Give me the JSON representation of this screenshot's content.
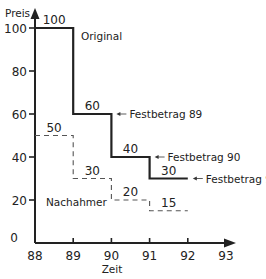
{
  "chart_data": {
    "type": "line",
    "title": "",
    "xlabel": "Zeit",
    "ylabel": "Preis",
    "xlim": [
      88,
      93
    ],
    "ylim": [
      0,
      100
    ],
    "x_ticks": [
      "88",
      "89",
      "90",
      "91",
      "92",
      "93"
    ],
    "y_ticks": [
      "0",
      "20",
      "40",
      "60",
      "80",
      "100"
    ],
    "grid": false,
    "step": true,
    "series": [
      {
        "name": "Original",
        "style": "solid",
        "color": "#222222",
        "segments": [
          {
            "x_start": 88,
            "x_end": 89,
            "value": 100,
            "label": "100"
          },
          {
            "x_start": 89,
            "x_end": 90,
            "value": 60,
            "label": "60"
          },
          {
            "x_start": 90,
            "x_end": 91,
            "value": 40,
            "label": "40"
          },
          {
            "x_start": 91,
            "x_end": 92,
            "value": 30,
            "label": "30"
          }
        ]
      },
      {
        "name": "Nachahmer",
        "style": "dashed",
        "color": "#555555",
        "segments": [
          {
            "x_start": 88,
            "x_end": 89,
            "value": 50,
            "label": "50"
          },
          {
            "x_start": 89,
            "x_end": 90,
            "value": 30,
            "label": "30"
          },
          {
            "x_start": 90,
            "x_end": 91,
            "value": 20,
            "label": "20"
          },
          {
            "x_start": 91,
            "x_end": 92,
            "value": 15,
            "label": "15"
          }
        ]
      }
    ],
    "annotations": [
      {
        "text": "Original",
        "series": "Original"
      },
      {
        "text": "Nachahmer",
        "series": "Nachahmer"
      },
      {
        "text": "Festbetrag 89",
        "arrow": true,
        "value": 60
      },
      {
        "text": "Festbetrag 90",
        "arrow": true,
        "value": 40
      },
      {
        "text": "Festbetrag 91",
        "arrow": true,
        "value": 30
      }
    ]
  }
}
